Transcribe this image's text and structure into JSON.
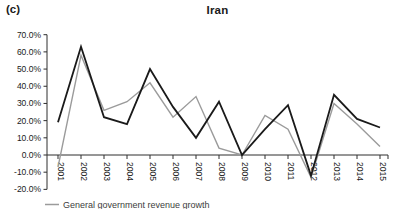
{
  "panel_label": "(c)",
  "title": "Iran",
  "colors": {
    "black_line": "#1a1a1a",
    "gray_line": "#9b9b9b",
    "axis": "#2e2e2e",
    "tick_text": "#1a1a1a",
    "legend_text": "#3d3d3d"
  },
  "legend": [
    {
      "label": "General government revenue growth",
      "color": "#9b9b9b"
    }
  ],
  "chart_data": {
    "type": "line",
    "title": "Iran",
    "x": [
      "2001",
      "2002",
      "2003",
      "2004",
      "2005",
      "2006",
      "2007",
      "2008",
      "2009",
      "2010",
      "2011",
      "2012",
      "2013",
      "2014",
      "2015"
    ],
    "series": [
      {
        "name": "General government revenue growth",
        "color": "#9b9b9b",
        "width": 1.4,
        "values": [
          -7,
          58,
          26,
          31,
          42,
          22,
          34,
          4,
          0,
          23,
          15,
          -13,
          30,
          18,
          5
        ]
      },
      {
        "name": "unlabeled-black-series",
        "color": "#1a1a1a",
        "width": 1.8,
        "values": [
          19,
          63,
          22,
          18,
          50,
          28,
          10,
          31,
          0,
          15,
          29,
          -12,
          35,
          21,
          16
        ]
      }
    ],
    "ylim": [
      -20,
      70
    ],
    "y_ticks": {
      "labels": [
        "70.0%",
        "60.0%",
        "50.0%",
        "40.0%",
        "30.0%",
        "20.0%",
        "10.0%",
        "0.0%",
        "-10.0%",
        "-20.0%"
      ],
      "values": [
        70,
        60,
        50,
        40,
        30,
        20,
        10,
        0,
        -10,
        -20
      ]
    },
    "grid": false,
    "legend_position": "bottom-left"
  }
}
